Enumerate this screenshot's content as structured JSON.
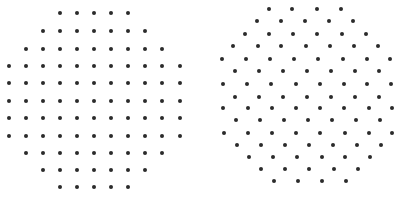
{
  "figure": {
    "dot_color": "#2b2b2b",
    "dot_diameter": 4,
    "panels": [
      {
        "name": "square-lattice-disc",
        "rows": [
          {
            "y": 13,
            "x": [
              60,
              77,
              94,
              111,
              128
            ]
          },
          {
            "y": 31,
            "x": [
              43,
              60,
              77,
              94,
              111,
              128,
              145
            ]
          },
          {
            "y": 49,
            "x": [
              26,
              43,
              60,
              77,
              94,
              111,
              128,
              145,
              162
            ]
          },
          {
            "y": 66,
            "x": [
              9,
              26,
              43,
              60,
              77,
              94,
              111,
              128,
              145,
              162,
              180
            ]
          },
          {
            "y": 83,
            "x": [
              9,
              26,
              43,
              60,
              77,
              94,
              111,
              128,
              145,
              162,
              180
            ]
          },
          {
            "y": 101,
            "x": [
              9,
              26,
              43,
              60,
              77,
              94,
              111,
              128,
              145,
              162,
              180
            ]
          },
          {
            "y": 118,
            "x": [
              9,
              26,
              43,
              60,
              77,
              94,
              111,
              128,
              145,
              162,
              180
            ]
          },
          {
            "y": 136,
            "x": [
              9,
              26,
              43,
              60,
              77,
              94,
              111,
              128,
              145,
              162,
              180
            ]
          },
          {
            "y": 153,
            "x": [
              26,
              43,
              60,
              77,
              94,
              111,
              128,
              145,
              162
            ]
          },
          {
            "y": 170,
            "x": [
              43,
              60,
              77,
              94,
              111,
              128,
              145
            ]
          },
          {
            "y": 187,
            "x": [
              60,
              77,
              94,
              111,
              128
            ]
          }
        ]
      },
      {
        "name": "hexagonal-lattice-disc",
        "rows": [
          {
            "y": 9,
            "x": [
              269,
              292,
              317,
              341
            ]
          },
          {
            "y": 21,
            "x": [
              257,
              281,
              305,
              329,
              353
            ]
          },
          {
            "y": 34,
            "x": [
              245,
              269,
              293,
              317,
              342,
              366
            ]
          },
          {
            "y": 46,
            "x": [
              233,
              258,
              281,
              306,
              330,
              354,
              378
            ]
          },
          {
            "y": 59,
            "x": [
              222,
              246,
              270,
              294,
              318,
              343,
              367,
              390
            ]
          },
          {
            "y": 71,
            "x": [
              235,
              259,
              283,
              307,
              331,
              355,
              379
            ]
          },
          {
            "y": 84,
            "x": [
              223,
              247,
              271,
              296,
              320,
              344,
              367,
              391
            ]
          },
          {
            "y": 97,
            "x": [
              235,
              259,
              283,
              307,
              331,
              355,
              379
            ]
          },
          {
            "y": 108,
            "x": [
              223,
              248,
              272,
              296,
              320,
              344,
              369,
              392
            ]
          },
          {
            "y": 120,
            "x": [
              236,
              260,
              284,
              308,
              332,
              356,
              380
            ]
          },
          {
            "y": 133,
            "x": [
              224,
              248,
              272,
              296,
              320,
              345,
              369,
              392
            ]
          },
          {
            "y": 145,
            "x": [
              237,
              261,
              285,
              309,
              333,
              357,
              381
            ]
          },
          {
            "y": 157,
            "x": [
              249,
              273,
              297,
              322,
              345,
              370
            ]
          },
          {
            "y": 169,
            "x": [
              261,
              285,
              309,
              334,
              358
            ]
          },
          {
            "y": 181,
            "x": [
              274,
              298,
              322,
              346
            ]
          }
        ]
      }
    ]
  }
}
